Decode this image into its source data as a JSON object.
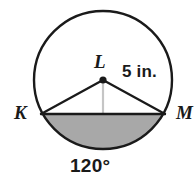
{
  "figure": {
    "type": "circle-segment-diagram",
    "background_color": "#ffffff",
    "stroke_color": "#1a1a1a",
    "shaded_fill_color": "#a8a8a8",
    "apothem_color": "#c8c8c8",
    "labels": {
      "center_point": "L",
      "radius_measure": "5 in.",
      "left_endpoint": "K",
      "right_endpoint": "M",
      "arc_angle": "120°"
    },
    "geometry": {
      "center_x": 103,
      "center_y": 80,
      "radius_px": 69,
      "chord_left_x": 41,
      "chord_right_x": 165,
      "chord_y": 114,
      "central_angle_degrees": 120,
      "radius_value": 5,
      "radius_unit": "in."
    }
  }
}
